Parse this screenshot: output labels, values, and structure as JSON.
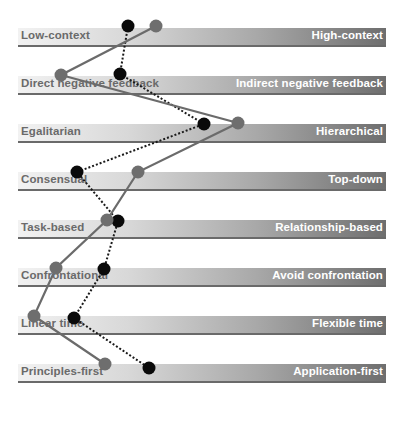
{
  "chart_data": {
    "type": "line",
    "title": "",
    "scales": [
      {
        "left": "Low-context",
        "right": "High-context"
      },
      {
        "left": "Direct negative feedback",
        "right": "Indirect negative feedback"
      },
      {
        "left": "Egalitarian",
        "right": "Hierarchical"
      },
      {
        "left": "Consensual",
        "right": "Top-down"
      },
      {
        "left": "Task-based",
        "right": "Relationship-based"
      },
      {
        "left": "Confrontational",
        "right": "Avoid confrontation"
      },
      {
        "left": "Linear time",
        "right": "Flexible time"
      },
      {
        "left": "Principles-first",
        "right": "Application-first"
      }
    ],
    "series": [
      {
        "name": "gray-solid",
        "style": "solid",
        "color": "#6b6b6b",
        "x_pixels": [
          156,
          61,
          238,
          138,
          107,
          56,
          34,
          105
        ],
        "values_pct": [
          38,
          12,
          60,
          33,
          24,
          10,
          4,
          24
        ]
      },
      {
        "name": "black-dotted",
        "style": "dotted",
        "color": "#000000",
        "x_pixels": [
          128,
          120,
          204,
          77,
          118,
          104,
          74,
          149
        ],
        "values_pct": [
          30,
          28,
          51,
          16,
          27,
          23,
          15,
          36
        ]
      }
    ],
    "xlim": [
      0,
      100
    ],
    "legend": "none",
    "grid": false
  },
  "layout": {
    "bar_left": 18,
    "bar_width": 368,
    "bar_tops": [
      28,
      76,
      124,
      172,
      220,
      268,
      316,
      364
    ],
    "dot_y": {
      "gray-solid": [
        26,
        75,
        123,
        172,
        220,
        268,
        316,
        364
      ],
      "black-dotted": [
        26,
        74,
        124,
        172,
        221,
        269,
        318,
        368
      ]
    }
  }
}
